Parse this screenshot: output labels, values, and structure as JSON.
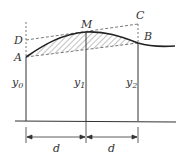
{
  "diagram": {
    "points": {
      "A": {
        "label": "A",
        "x": 26,
        "y": 57
      },
      "B": {
        "label": "B",
        "x": 138,
        "y": 43
      },
      "C": {
        "label": "C",
        "x": 138,
        "y": 24
      },
      "D": {
        "label": "D",
        "x": 26,
        "y": 40
      },
      "M": {
        "label": "M",
        "x": 86,
        "y": 32
      }
    },
    "ordinates": [
      {
        "base": "y",
        "sub": "0",
        "x": 26
      },
      {
        "base": "y",
        "sub": "1",
        "x": 86
      },
      {
        "base": "y",
        "sub": "2",
        "x": 138
      }
    ],
    "spacing": [
      {
        "label": "d"
      },
      {
        "label": "d"
      }
    ],
    "colors": {
      "line": "#333333",
      "dashed": "#555555",
      "hatch": "#666666"
    }
  }
}
